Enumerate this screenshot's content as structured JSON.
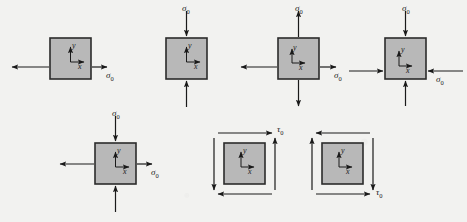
{
  "figure": {
    "background_color": "#f2f2f0",
    "block_fill": "#b8b8b8",
    "block_stroke": "#2b2b2b",
    "arrow_color": "#1a1a1a",
    "width": 467,
    "height": 222,
    "axis_labels": {
      "x": "x",
      "y": "y"
    },
    "normal_stress_symbol": "σ",
    "shear_stress_symbol": "τ",
    "subscript": "0"
  },
  "elements": [
    {
      "id": "uniaxial-tension",
      "name": "Uniaxial tension in x",
      "row": 1,
      "col": 1,
      "box": {
        "x": 50,
        "y": 38,
        "w": 41,
        "h": 41
      },
      "arrows": [
        {
          "dir": "left",
          "sense": "outward",
          "label": ""
        },
        {
          "dir": "right",
          "sense": "outward",
          "label": "σ"
        }
      ],
      "label_text": "σ",
      "label_sub": "0",
      "label_pos": {
        "x": 111,
        "y": 67
      }
    },
    {
      "id": "uniaxial-compression-y",
      "name": "Uniaxial compression in y",
      "row": 1,
      "col": 2,
      "box": {
        "x": 166,
        "y": 38,
        "w": 41,
        "h": 41
      },
      "arrows": [
        {
          "dir": "up",
          "sense": "inward",
          "label": "σ"
        },
        {
          "dir": "down",
          "sense": "inward",
          "label": ""
        }
      ],
      "label_text": "σ",
      "label_sub": "0",
      "label_pos": {
        "x": 181,
        "y": 12
      }
    },
    {
      "id": "biaxial-tension",
      "name": "Biaxial tension",
      "row": 1,
      "col": 3,
      "box": {
        "x": 278,
        "y": 38,
        "w": 41,
        "h": 41
      },
      "arrows": [
        {
          "dir": "left",
          "sense": "outward",
          "label": ""
        },
        {
          "dir": "right",
          "sense": "outward",
          "label": "σ"
        },
        {
          "dir": "up",
          "sense": "outward",
          "label": "σ"
        },
        {
          "dir": "down",
          "sense": "outward",
          "label": ""
        }
      ],
      "label_text": "σ",
      "label_sub": "0",
      "label_pos": {
        "x": 340,
        "y": 67
      },
      "label2_pos": {
        "x": 295,
        "y": 12
      }
    },
    {
      "id": "biaxial-compression",
      "name": "Biaxial compression",
      "row": 1,
      "col": 4,
      "box": {
        "x": 385,
        "y": 38,
        "w": 41,
        "h": 41
      },
      "arrows": [
        {
          "dir": "left",
          "sense": "inward",
          "label": ""
        },
        {
          "dir": "right",
          "sense": "inward",
          "label": "σ"
        },
        {
          "dir": "up",
          "sense": "inward",
          "label": "σ"
        },
        {
          "dir": "down",
          "sense": "inward",
          "label": ""
        }
      ],
      "label_text": "σ",
      "label_sub": "0",
      "label_pos": {
        "x": 441,
        "y": 74
      },
      "label2_pos": {
        "x": 401,
        "y": 12
      }
    },
    {
      "id": "tension-compression",
      "name": "Tension in x with compression in y",
      "row": 2,
      "col": 1,
      "box": {
        "x": 95,
        "y": 143,
        "w": 41,
        "h": 41
      },
      "arrows": [
        {
          "dir": "left",
          "sense": "outward",
          "label": ""
        },
        {
          "dir": "right",
          "sense": "outward",
          "label": "σ"
        },
        {
          "dir": "up",
          "sense": "inward",
          "label": "σ"
        },
        {
          "dir": "down",
          "sense": "inward",
          "label": ""
        }
      ],
      "label_text": "σ",
      "label_sub": "0",
      "label_pos": {
        "x": 156,
        "y": 172
      },
      "label2_pos": {
        "x": 111,
        "y": 117
      }
    },
    {
      "id": "pure-shear-positive",
      "name": "Pure shear, positive sense",
      "row": 2,
      "col": 2,
      "box": {
        "x": 224,
        "y": 143,
        "w": 41,
        "h": 41
      },
      "arrows": [
        {
          "dir": "top-right",
          "sense": "shear",
          "label": "τ"
        },
        {
          "dir": "bottom-left",
          "sense": "shear",
          "label": ""
        },
        {
          "dir": "left-down",
          "sense": "shear",
          "label": ""
        },
        {
          "dir": "right-up",
          "sense": "shear",
          "label": ""
        }
      ],
      "label_text": "τ",
      "label_sub": "0",
      "label_pos": {
        "x": 285,
        "y": 128
      }
    },
    {
      "id": "pure-shear-negative",
      "name": "Pure shear, negative sense",
      "row": 2,
      "col": 3,
      "box": {
        "x": 322,
        "y": 143,
        "w": 41,
        "h": 41
      },
      "arrows": [
        {
          "dir": "top-left",
          "sense": "shear",
          "label": ""
        },
        {
          "dir": "bottom-right",
          "sense": "shear",
          "label": "τ"
        },
        {
          "dir": "left-up",
          "sense": "shear",
          "label": ""
        },
        {
          "dir": "right-down",
          "sense": "shear",
          "label": ""
        }
      ],
      "label_text": "τ",
      "label_sub": "0",
      "label_pos": {
        "x": 383,
        "y": 196
      }
    }
  ],
  "labels": {
    "sigma0_1": "σ",
    "sigma0_1_sub": "0",
    "sigma0_2": "σ",
    "sigma0_2_sub": "0",
    "sigma0_3a": "σ",
    "sigma0_3a_sub": "0",
    "sigma0_3b": "σ",
    "sigma0_3b_sub": "0",
    "sigma0_4a": "σ",
    "sigma0_4a_sub": "0",
    "sigma0_4b": "σ",
    "sigma0_4b_sub": "0",
    "sigma0_5a": "σ",
    "sigma0_5a_sub": "0",
    "sigma0_5b": "σ",
    "sigma0_5b_sub": "0",
    "tau0_6": "τ",
    "tau0_6_sub": "0",
    "tau0_7": "τ",
    "tau0_7_sub": "0",
    "x": "x",
    "y": "y"
  }
}
